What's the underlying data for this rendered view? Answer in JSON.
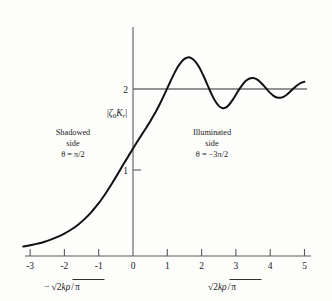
{
  "figure": {
    "title": "",
    "background": "#fdfdfc",
    "curve_color": "#111111",
    "axis_color": "#5a5a5a"
  },
  "axes": {
    "x_ticks": [
      "-3",
      "-2",
      "-1",
      "0",
      "1",
      "2",
      "3",
      "4",
      "5"
    ],
    "x_tick_values": [
      -3,
      -2,
      -1,
      0,
      1,
      2,
      3,
      4,
      5
    ],
    "y_ticks": [
      "1",
      "2"
    ],
    "y_tick_values": [
      1,
      2
    ],
    "x_title_left": "−√(2kρ/π)",
    "x_title_right": "√(2kρ/π)",
    "y_title": "|ζ₀Kᵣ|",
    "xlim": [
      -3.25,
      5.35
    ],
    "ylim": [
      0,
      2.75
    ]
  },
  "annotations": {
    "left": {
      "line1": "Shadowed",
      "line2": "side",
      "line3": "θ = π/2"
    },
    "right": {
      "line1": "Illuminated",
      "line2": "side",
      "line3": "θ = −3π/2"
    }
  },
  "math_glyphs": {
    "minus": "−",
    "radical": "√",
    "two": "2",
    "k": "k",
    "rho": "ρ",
    "pi": "π",
    "zeta": "ζ",
    "zero_sub": "0",
    "K": "K",
    "r_sub": "r",
    "bar": "|"
  },
  "chart_data": {
    "type": "line",
    "title": "",
    "xlabel": "√(2kρ/π)",
    "ylabel": "|ζ₀Kᵣ|",
    "xlim": [
      -3.25,
      5.35
    ],
    "ylim": [
      0,
      2.75
    ],
    "grid": false,
    "legend": null,
    "asymptote_y": 2,
    "value_at_zero": 1,
    "series": [
      {
        "name": "|ζ₀Kᵣ|",
        "x": [
          -3.2,
          -3.0,
          -2.8,
          -2.6,
          -2.4,
          -2.2,
          -2.0,
          -1.8,
          -1.6,
          -1.4,
          -1.2,
          -1.0,
          -0.9,
          -0.8,
          -0.7,
          -0.6,
          -0.5,
          -0.4,
          -0.3,
          -0.2,
          -0.1,
          0.0,
          0.1,
          0.2,
          0.3,
          0.4,
          0.5,
          0.6,
          0.7,
          0.8,
          0.9,
          1.0,
          1.1,
          1.2,
          1.3,
          1.4,
          1.5,
          1.6,
          1.7,
          1.8,
          1.9,
          2.0,
          2.1,
          2.2,
          2.3,
          2.4,
          2.5,
          2.6,
          2.7,
          2.8,
          2.9,
          3.0,
          3.1,
          3.2,
          3.3,
          3.4,
          3.5,
          3.6,
          3.7,
          3.8,
          3.9,
          4.0,
          4.1,
          4.2,
          4.3,
          4.4,
          4.5,
          4.6,
          4.7,
          4.8,
          4.9,
          5.0
        ],
        "y": [
          0.055,
          0.07,
          0.09,
          0.112,
          0.14,
          0.175,
          0.215,
          0.265,
          0.325,
          0.4,
          0.487,
          0.59,
          0.648,
          0.71,
          0.775,
          0.843,
          0.912,
          0.983,
          1.055,
          1.125,
          1.196,
          1.265,
          1.334,
          1.4,
          1.466,
          1.532,
          1.6,
          1.672,
          1.748,
          1.83,
          1.918,
          2.01,
          2.102,
          2.19,
          2.268,
          2.33,
          2.372,
          2.39,
          2.382,
          2.348,
          2.29,
          2.212,
          2.12,
          2.022,
          1.928,
          1.848,
          1.792,
          1.765,
          1.77,
          1.805,
          1.862,
          1.93,
          1.998,
          2.058,
          2.104,
          2.13,
          2.136,
          2.122,
          2.09,
          2.046,
          1.998,
          1.952,
          1.916,
          1.895,
          1.892,
          1.906,
          1.936,
          1.974,
          2.014,
          2.05,
          2.076,
          2.09
        ]
      }
    ],
    "extrema": [
      {
        "kind": "maximum",
        "x": 1.1,
        "y": 2.55,
        "order": 1
      },
      {
        "kind": "minimum",
        "x": 1.72,
        "y": 1.48,
        "order": 1
      },
      {
        "kind": "maximum",
        "x": 2.25,
        "y": 2.36,
        "order": 2
      },
      {
        "kind": "minimum",
        "x": 2.7,
        "y": 1.66,
        "order": 2
      },
      {
        "kind": "maximum",
        "x": 3.1,
        "y": 2.26,
        "order": 3
      },
      {
        "kind": "minimum",
        "x": 3.48,
        "y": 1.76,
        "order": 3
      },
      {
        "kind": "maximum",
        "x": 3.82,
        "y": 2.19,
        "order": 4
      },
      {
        "kind": "minimum",
        "x": 4.14,
        "y": 1.82,
        "order": 4
      },
      {
        "kind": "maximum",
        "x": 4.44,
        "y": 2.14,
        "order": 5
      },
      {
        "kind": "minimum",
        "x": 4.72,
        "y": 1.87,
        "order": 5
      },
      {
        "kind": "maximum",
        "x": 4.96,
        "y": 2.1,
        "order": 6
      }
    ]
  }
}
